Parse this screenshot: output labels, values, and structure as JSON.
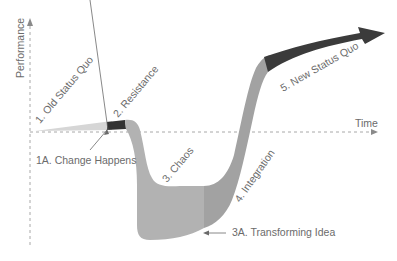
{
  "axes": {
    "y_label": "Performance",
    "x_label": "Time"
  },
  "stages": {
    "s1": "1. Old Status Quo",
    "s1a": "1A. Change Happens",
    "s2": "2. Resistance",
    "s3": "3. Chaos",
    "s3a": "3A. Transforming Idea",
    "s4": "4. Integration",
    "s5": "5. New Status Quo"
  },
  "colors": {
    "light_band": "#d4d4d4",
    "mid_band": "#a9a9a9",
    "chaos_band": "#b3b3b3",
    "integration_band": "#a0a0a0",
    "dark_band": "#3a3a3a",
    "axis": "#9a9a9a",
    "text": "#6b6b6b"
  }
}
